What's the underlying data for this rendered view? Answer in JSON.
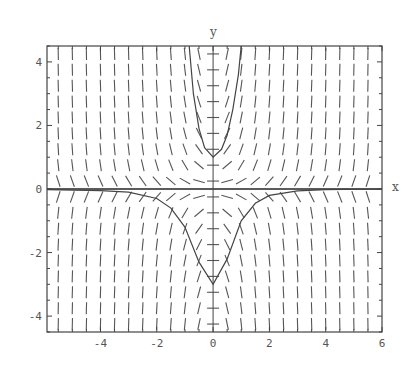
{
  "chart_data": {
    "type": "line",
    "subtype": "slope-field-with-solution-curves",
    "title": "",
    "xlabel": "x",
    "ylabel": "y",
    "xlim": [
      -5.9,
      6.0
    ],
    "ylim": [
      -4.5,
      4.5
    ],
    "x_ticks": [
      -4,
      -2,
      0,
      2,
      4,
      6
    ],
    "y_ticks": [
      -4,
      -2,
      0,
      2,
      4
    ],
    "x_tick_labels": [
      "-4",
      "-2",
      "0",
      "2",
      "4",
      "6"
    ],
    "y_tick_labels": [
      "-4",
      "-2",
      "0",
      "2",
      "4"
    ],
    "grid": false,
    "legend": null,
    "slope_field": {
      "description": "Direction field of short dashes; nearly vertical for |y| large, flattening near the origin",
      "x_spacing": 0.5,
      "y_spacing": 0.5
    },
    "series": [
      {
        "name": "solution through (0,1)",
        "description": "U-shaped curve, minimum y=1 at x=0, rising steeply to top of frame near x≈-0.85 and x≈1.0",
        "points": [
          [
            -0.85,
            4.5
          ],
          [
            -0.7,
            3.0
          ],
          [
            -0.5,
            1.9
          ],
          [
            -0.3,
            1.3
          ],
          [
            0,
            1.0
          ],
          [
            0.3,
            1.25
          ],
          [
            0.5,
            1.7
          ],
          [
            0.7,
            2.5
          ],
          [
            0.9,
            3.6
          ],
          [
            1.0,
            4.5
          ]
        ]
      },
      {
        "name": "solution through (0,-3)",
        "description": "Bell-shaped well, minimum y=-3 at x=0, approaching y=0 asymptotically as |x| grows",
        "points": [
          [
            -5.9,
            -0.02
          ],
          [
            -4,
            -0.05
          ],
          [
            -3,
            -0.1
          ],
          [
            -2,
            -0.3
          ],
          [
            -1.5,
            -0.6
          ],
          [
            -1,
            -1.2
          ],
          [
            -0.5,
            -2.3
          ],
          [
            0,
            -3.0
          ],
          [
            0.5,
            -2.2
          ],
          [
            1,
            -1.0
          ],
          [
            1.5,
            -0.45
          ],
          [
            2,
            -0.2
          ],
          [
            3,
            -0.06
          ],
          [
            4,
            -0.02
          ],
          [
            6,
            0.0
          ]
        ]
      },
      {
        "name": "equilibrium y=0",
        "points": [
          [
            -5.9,
            0
          ],
          [
            6,
            0
          ]
        ]
      }
    ]
  }
}
